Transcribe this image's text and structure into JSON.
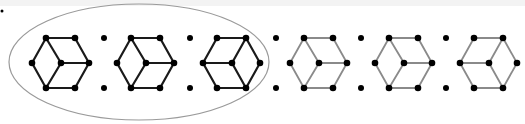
{
  "diagram": {
    "colors": {
      "dark_edge": "#1a1a1a",
      "light_edge": "#8a8a8a",
      "vertex": "#000000",
      "ellipse": "#9a9a9a",
      "top_band": "#f3f3f3"
    },
    "corner_dot": {
      "x": 2,
      "y": 11
    },
    "ellipse": {
      "cx": 139,
      "cy": 62,
      "rx": 130,
      "ry": 58
    },
    "separators": [
      {
        "x": 104,
        "top_y": 38,
        "bottom_y": 88
      },
      {
        "x": 190,
        "top_y": 38,
        "bottom_y": 88
      },
      {
        "x": 276,
        "top_y": 38,
        "bottom_y": 88
      },
      {
        "x": 361,
        "top_y": 38,
        "bottom_y": 88
      },
      {
        "x": 446,
        "top_y": 38,
        "bottom_y": 88
      }
    ],
    "cubes": [
      {
        "index": 1,
        "offset_x": 32,
        "style": "dark",
        "center_links": [
          "TL",
          "R",
          "BL"
        ],
        "enclosed": true
      },
      {
        "index": 2,
        "offset_x": 117,
        "style": "dark",
        "center_links": [
          "TL",
          "R",
          "BL"
        ],
        "enclosed": true
      },
      {
        "index": 3,
        "offset_x": 203,
        "style": "dark",
        "center_links": [
          "L",
          "TR",
          "BR"
        ],
        "enclosed": true
      },
      {
        "index": 4,
        "offset_x": 290,
        "style": "light",
        "center_links": [
          "TL",
          "R",
          "BL"
        ],
        "enclosed": false
      },
      {
        "index": 5,
        "offset_x": 375,
        "style": "light",
        "center_links": [
          "TL",
          "R",
          "BL"
        ],
        "enclosed": false
      },
      {
        "index": 6,
        "offset_x": 460,
        "style": "light",
        "center_links": [
          "L",
          "TR",
          "BR"
        ],
        "enclosed": false
      }
    ],
    "hexagon_geometry": {
      "L": [
        0,
        63
      ],
      "TL": [
        14,
        38
      ],
      "TR": [
        43,
        38
      ],
      "R": [
        57,
        63
      ],
      "BR": [
        43,
        88
      ],
      "BL": [
        14,
        88
      ],
      "C": [
        29,
        63
      ]
    }
  }
}
